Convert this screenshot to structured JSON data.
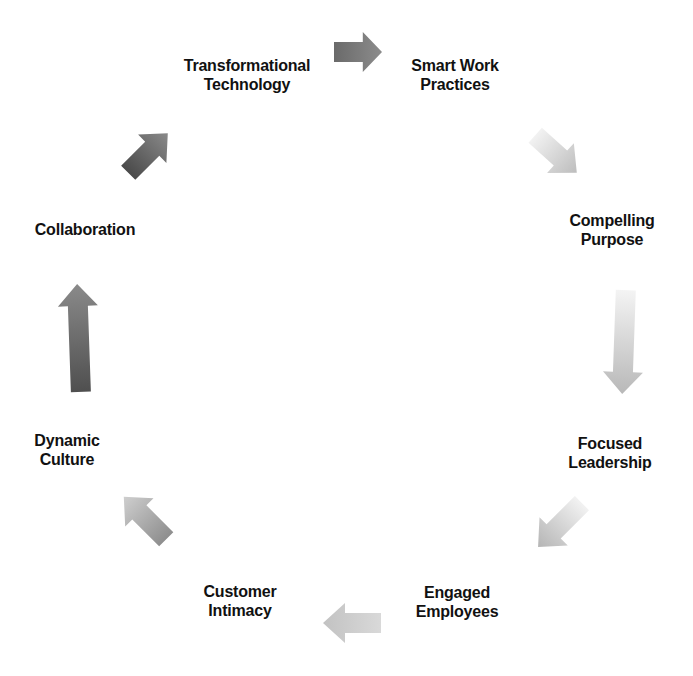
{
  "diagram": {
    "type": "cycle",
    "direction": "clockwise",
    "nodes": [
      {
        "id": "transformational-technology",
        "lines": [
          "Transformational",
          "Technology"
        ],
        "x": 247,
        "y": 75
      },
      {
        "id": "smart-work-practices",
        "lines": [
          "Smart Work",
          "Practices"
        ],
        "x": 455,
        "y": 75
      },
      {
        "id": "compelling-purpose",
        "lines": [
          "Compelling",
          "Purpose"
        ],
        "x": 612,
        "y": 230
      },
      {
        "id": "focused-leadership",
        "lines": [
          "Focused",
          "Leadership"
        ],
        "x": 610,
        "y": 453
      },
      {
        "id": "engaged-employees",
        "lines": [
          "Engaged",
          "Employees"
        ],
        "x": 457,
        "y": 602
      },
      {
        "id": "customer-intimacy",
        "lines": [
          "Customer",
          "Intimacy"
        ],
        "x": 240,
        "y": 601
      },
      {
        "id": "dynamic-culture",
        "lines": [
          "Dynamic",
          "Culture"
        ],
        "x": 67,
        "y": 450
      },
      {
        "id": "collaboration",
        "lines": [
          "Collaboration"
        ],
        "x": 85,
        "y": 229
      }
    ],
    "arrows": [
      {
        "from": "transformational-technology",
        "to": "smart-work-practices",
        "x": 358,
        "y": 52,
        "angle": 0,
        "length": 48,
        "color_start": "#6a6a6a",
        "color_end": "#8c8c8c"
      },
      {
        "from": "smart-work-practices",
        "to": "compelling-purpose",
        "x": 556,
        "y": 154,
        "angle": 42,
        "length": 56,
        "color_start": "#f2f2f2",
        "color_end": "#bdbdbd"
      },
      {
        "from": "compelling-purpose",
        "to": "focused-leadership",
        "x": 624,
        "y": 342,
        "angle": 92,
        "length": 104,
        "color_start": "#f4f4f4",
        "color_end": "#b8b8b8"
      },
      {
        "from": "focused-leadership",
        "to": "engaged-employees",
        "x": 560,
        "y": 525,
        "angle": 135,
        "length": 62,
        "color_start": "#f2f2f2",
        "color_end": "#b5b5b5"
      },
      {
        "from": "engaged-employees",
        "to": "customer-intimacy",
        "x": 352,
        "y": 623,
        "angle": 180,
        "length": 58,
        "color_start": "#d9d9d9",
        "color_end": "#c2c2c2"
      },
      {
        "from": "customer-intimacy",
        "to": "dynamic-culture",
        "x": 145,
        "y": 518,
        "angle": 225,
        "length": 60,
        "color_start": "#8e8e8e",
        "color_end": "#cfcfcf"
      },
      {
        "from": "dynamic-culture",
        "to": "collaboration",
        "x": 79,
        "y": 338,
        "angle": 268,
        "length": 108,
        "color_start": "#4f4f4f",
        "color_end": "#8a8a8a"
      },
      {
        "from": "collaboration",
        "to": "transformational-technology",
        "x": 148,
        "y": 153,
        "angle": 315,
        "length": 56,
        "color_start": "#4a4a4a",
        "color_end": "#8a8a8a"
      }
    ]
  }
}
